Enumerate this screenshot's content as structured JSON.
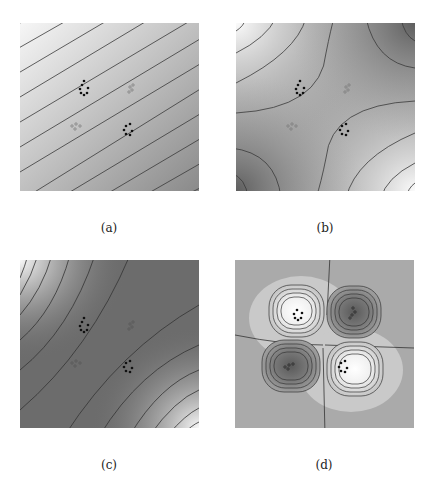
{
  "figure": {
    "panels": [
      {
        "id": "a",
        "caption": "(a)",
        "description": "Linear gradient field with parallel diagonal contour lines; light at top-left, dark at bottom-right"
      },
      {
        "id": "b",
        "caption": "(b)",
        "description": "Saddle (hyperbolic) field with dark top-right and bottom-left corners, light top-left and bottom-right corners"
      },
      {
        "id": "c",
        "caption": "(c)",
        "description": "Dark diagonal valley from bottom-left to top-right with curved contours brightening toward top-left and bottom-right corners"
      },
      {
        "id": "d",
        "caption": "(d)",
        "description": "Quadrupole field with two light lobes (top-left, bottom-right) and two dark lobes (top-right, bottom-left) around a flat gray background"
      }
    ],
    "markers": {
      "dark_clusters": [
        "upper-left cluster",
        "lower-right cluster"
      ],
      "light_clusters": [
        "upper-right cluster",
        "lower-left cluster"
      ]
    },
    "colors": {
      "background": "#ffffff",
      "contour_line": "#3a3a3a",
      "light": "#f2f2f2",
      "mid": "#a8a8a8",
      "dark": "#5a5a5a",
      "marker_dark": "#111111",
      "marker_light": "#888888"
    }
  }
}
